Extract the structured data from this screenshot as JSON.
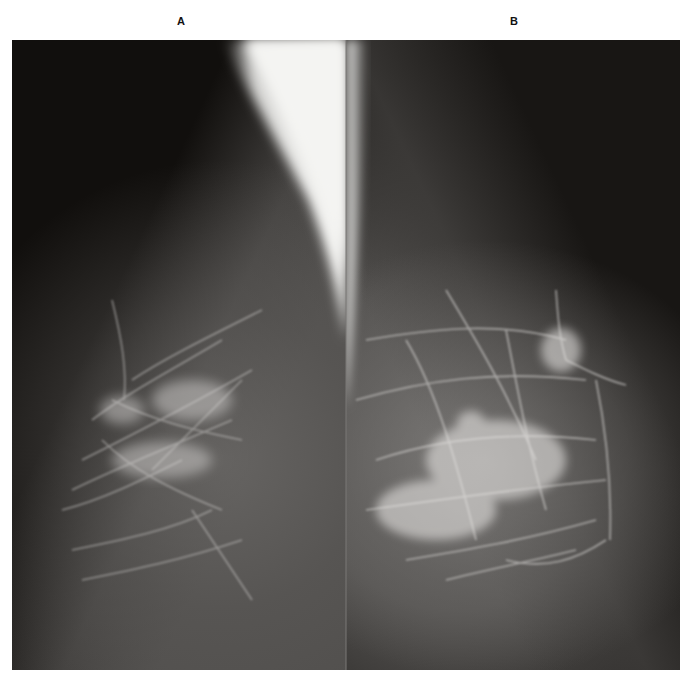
{
  "figure": {
    "panels": [
      {
        "label": "A",
        "description": "Mediolateral oblique mammogram, scattered fibroglandular tissue"
      },
      {
        "label": "B",
        "description": "Mediolateral oblique mammogram, heterogeneously dense fibroglandular tissue"
      }
    ],
    "colors": {
      "background": "#ffffff",
      "film_dark": "#141210",
      "tissue_gray": "#5a5856",
      "pectoral_bright": "#f2f2f0",
      "label_text": "#111111"
    }
  }
}
